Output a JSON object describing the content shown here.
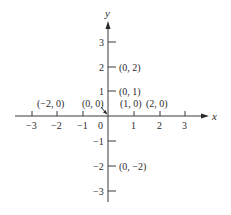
{
  "diagram": {
    "type": "cartesian-coordinate-plane",
    "axes": {
      "x_label": "x",
      "y_label": "y",
      "x_ticks": [
        "−3",
        "−2",
        "−1",
        "0",
        "1",
        "2",
        "3"
      ],
      "y_ticks_positive": [
        "3",
        "2",
        "1"
      ],
      "y_ticks_negative": [
        "−1",
        "−2",
        "−3"
      ]
    },
    "points": [
      {
        "label": "(−2, 0)",
        "x": -2,
        "y": 0
      },
      {
        "label": "(0, 0)",
        "x": 0,
        "y": 0
      },
      {
        "label": "(1, 0)",
        "x": 1,
        "y": 0
      },
      {
        "label": "(2, 0)",
        "x": 2,
        "y": 0
      },
      {
        "label": "(0, 1)",
        "x": 0,
        "y": 1
      },
      {
        "label": "(0, 2)",
        "x": 0,
        "y": 2
      },
      {
        "label": "(0, −2)",
        "x": 0,
        "y": -2
      }
    ],
    "colors": {
      "ink": "#2a2a2a",
      "background": "#ffffff"
    }
  }
}
